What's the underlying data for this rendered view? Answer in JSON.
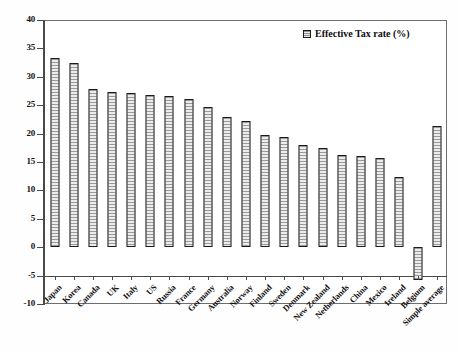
{
  "chart_data": {
    "type": "bar",
    "title": "",
    "xlabel": "",
    "ylabel": "",
    "ylim": [
      -10,
      40
    ],
    "ytick_step": 5,
    "yticks": [
      40,
      35,
      30,
      25,
      20,
      15,
      10,
      5,
      0,
      -5,
      -10
    ],
    "grid": false,
    "legend_position": "top-right",
    "legend": [
      "Effective Tax rate (%)"
    ],
    "series_name": "Effective Tax rate (%)",
    "categories": [
      "Japan",
      "Korea",
      "Canada",
      "UK",
      "Italy",
      "US",
      "Russia",
      "France",
      "Germany",
      "Australia",
      "Norway",
      "Finland",
      "Sweden",
      "Denmark",
      "New Zealand",
      "Netherlands",
      "China",
      "Mexico",
      "Ireland",
      "Belgium",
      "Simple average"
    ],
    "values": [
      33.3,
      32.5,
      27.9,
      27.4,
      27.1,
      26.8,
      26.7,
      26.1,
      24.7,
      23.0,
      22.3,
      19.7,
      19.4,
      18.0,
      17.5,
      16.2,
      16.0,
      15.7,
      12.3,
      -5.7,
      21.3
    ]
  },
  "legend": {
    "label": "Effective Tax rate (%)",
    "marker": "hatched-square-icon"
  },
  "colors": {
    "bar_fill": "#d8d8d8",
    "bar_border": "#1b1b1b",
    "axis": "#4a4a4a",
    "text": "#101010",
    "background": "#ffffff"
  }
}
